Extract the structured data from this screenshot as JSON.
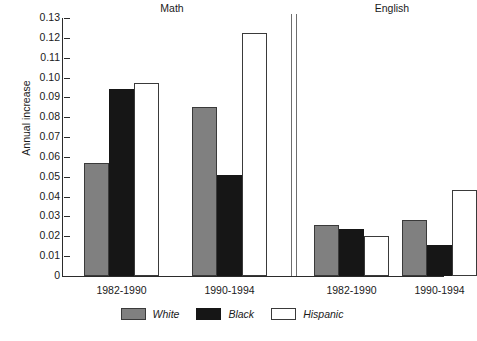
{
  "chart_data": {
    "type": "bar",
    "title": "",
    "xlabel": "",
    "ylabel": "Annual increase",
    "ylim": [
      0,
      0.13
    ],
    "ytick_labels": [
      "0.13",
      "0.12",
      "0.11",
      "0.10",
      "0.09",
      "0.08",
      "0.07",
      "0.06",
      "0.05",
      "0.04",
      "0.03",
      "0.02",
      "0.01",
      "0"
    ],
    "ytick_values": [
      0.13,
      0.12,
      0.11,
      0.1,
      0.09,
      0.08,
      0.07,
      0.06,
      0.05,
      0.04,
      0.03,
      0.02,
      0.01,
      0
    ],
    "grid": false,
    "legend_position": "bottom-center",
    "panels": [
      {
        "name": "Math",
        "categories": [
          "1982-1990",
          "1990-1994"
        ]
      },
      {
        "name": "English",
        "categories": [
          "1982-1990",
          "1990-1994"
        ]
      }
    ],
    "categories": [
      "Math 1982-1990",
      "Math 1990-1994",
      "English 1982-1990",
      "English 1990-1994"
    ],
    "series": [
      {
        "name": "White",
        "color": "#808080",
        "values": [
          0.057,
          0.085,
          0.0255,
          0.028
        ]
      },
      {
        "name": "Black",
        "color": "#161616",
        "values": [
          0.094,
          0.051,
          0.0235,
          0.0155
        ]
      },
      {
        "name": "Hispanic",
        "color": "#ffffff",
        "values": [
          0.0975,
          0.1225,
          0.02,
          0.0435
        ]
      }
    ]
  },
  "legend": {
    "entries": [
      {
        "label": "White"
      },
      {
        "label": "Black"
      },
      {
        "label": "Hispanic"
      }
    ]
  }
}
